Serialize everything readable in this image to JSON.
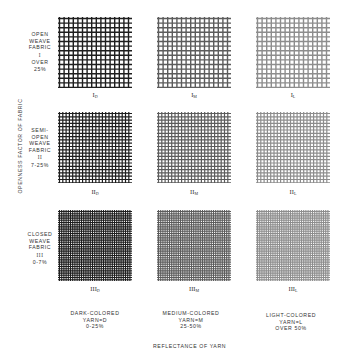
{
  "figure": {
    "y_axis_label": "OPENNESS FACTOR OF FABRIC",
    "x_axis_label": "REFLECTANCE OF YARN",
    "rows": [
      {
        "lines": [
          "OPEN",
          "WEAVE",
          "FABRIC",
          "I",
          "OVER",
          "25%"
        ],
        "numeral": "I",
        "spacing": 4.6,
        "stroke": 1.4,
        "color": "#1e1e1e"
      },
      {
        "lines": [
          "SEMI-",
          "OPEN",
          "WEAVE",
          "FABRIC",
          "II",
          "7-25%"
        ],
        "numeral": "II",
        "spacing": 3.3,
        "stroke": 1.2,
        "color": "#1e1e1e"
      },
      {
        "lines": [
          "CLOSED",
          "WEAVE",
          "FABRIC",
          "III",
          "0-7%"
        ],
        "numeral": "III",
        "spacing": 2.2,
        "stroke": 1.1,
        "color": "#1e1e1e"
      }
    ],
    "columns": [
      {
        "lines": [
          "DARK-COLORED",
          "YARN=D",
          "0-25%"
        ],
        "sub": "D",
        "opacity": 1.0
      },
      {
        "lines": [
          "MEDIUM-COLORED",
          "YARN=M",
          "25-50%"
        ],
        "sub": "M",
        "opacity": 0.72
      },
      {
        "lines": [
          "LIGHT-COLORED",
          "YARN=L",
          "OVER 50%"
        ],
        "sub": "L",
        "opacity": 0.5
      }
    ],
    "cells": [
      {
        "id": "I_D",
        "numeral": "I",
        "sub": "D"
      },
      {
        "id": "I_M",
        "numeral": "I",
        "sub": "M"
      },
      {
        "id": "I_L",
        "numeral": "I",
        "sub": "L"
      },
      {
        "id": "II_D",
        "numeral": "II",
        "sub": "D"
      },
      {
        "id": "II_M",
        "numeral": "II",
        "sub": "M"
      },
      {
        "id": "II_L",
        "numeral": "II",
        "sub": "L"
      },
      {
        "id": "III_D",
        "numeral": "III",
        "sub": "D"
      },
      {
        "id": "III_M",
        "numeral": "III",
        "sub": "M"
      },
      {
        "id": "III_L",
        "numeral": "III",
        "sub": "L"
      }
    ]
  }
}
